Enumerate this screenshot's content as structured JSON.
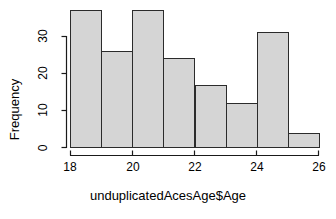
{
  "chart_data": {
    "type": "bar",
    "chart_subtype": "histogram",
    "title": "",
    "xlabel": "unduplicatedAcesAge$Age",
    "ylabel": "Frequency",
    "categories": [
      "18-19",
      "19-20",
      "20-21",
      "21-22",
      "22-23",
      "23-24",
      "24-25",
      "25-26"
    ],
    "bin_edges": [
      18,
      19,
      20,
      21,
      22,
      23,
      24,
      25,
      26
    ],
    "values": [
      37,
      26,
      37,
      24,
      17,
      12,
      31,
      4
    ],
    "clipped_bars": [
      0,
      2
    ],
    "xlim": [
      18,
      26
    ],
    "ylim": [
      0,
      38
    ],
    "xticks": [
      18,
      20,
      22,
      24,
      26
    ],
    "xtick_labels": [
      "18",
      "20",
      "22",
      "24",
      "26"
    ],
    "yticks": [
      0,
      10,
      20,
      30
    ],
    "ytick_labels": [
      "0",
      "10",
      "20",
      "30"
    ],
    "grid": false,
    "legend": null,
    "bar_fill": "#d5d5d5",
    "bar_border": "#2b2b2b",
    "axis_color": "#1a1a1a",
    "background": "#ffffff"
  }
}
